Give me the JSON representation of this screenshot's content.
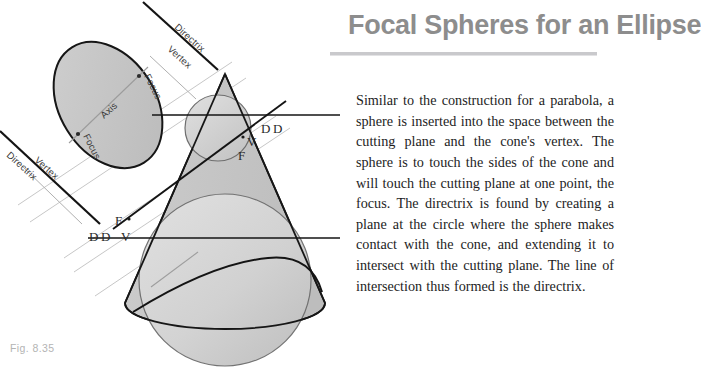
{
  "page": {
    "background_color": "#ffffff"
  },
  "heading": {
    "title": "Focal Spheres for an Ellipse",
    "title_color": "#8d8d8d",
    "rule_color": "#c9c9cc"
  },
  "body": {
    "paragraph": "Similar to the construction for a parabola, a sphere is inserted into the space between the cutting plane and the cone's vertex. The sphere is to touch the sides of the cone and will touch the cutting plane at one point, the focus. The directrix is found by creating a plane at the circle where the sphere makes contact with the cone, and extending it to intersect with the cutting plane. The line of intersection thus formed is the directrix."
  },
  "figure": {
    "caption": "Fig. 8.35",
    "caption_color": "#b4b4b4",
    "labels": {
      "directrix_top": "Directrix",
      "directrix_bottom": "Directrix",
      "vertex_top": "Vertex",
      "vertex_bottom": "Vertex",
      "focus_top": "Focus",
      "focus_bottom": "Focus",
      "axis": "Axis",
      "cone_d_upper_left": "D",
      "cone_d_upper_right": "D",
      "cone_v_upper": "V",
      "cone_f_upper": "F",
      "cone_d_lower_left": "D",
      "cone_d_lower_right": "D",
      "cone_v_lower": "V",
      "cone_f_lower": "F"
    },
    "colors": {
      "cone_fill": "#c7c7c7",
      "sphere_fill": "#d5d5d5",
      "ellipse_fill": "#c9c9c9",
      "outline": "#1a1a1a",
      "guide_line": "#b8b8b8"
    }
  }
}
